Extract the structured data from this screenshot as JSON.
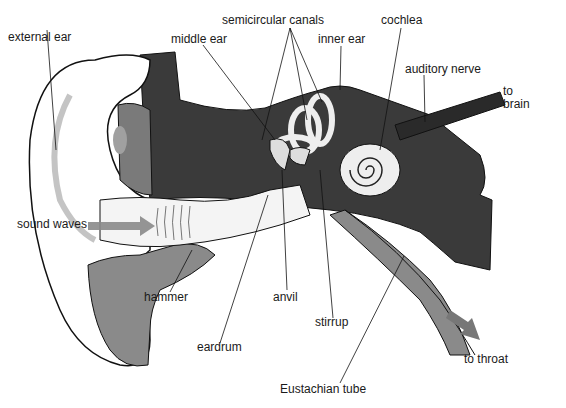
{
  "diagram": {
    "labels": {
      "external_ear": "external ear",
      "middle_ear": "middle ear",
      "semicircular_canals": "semicircular canals",
      "inner_ear": "inner ear",
      "cochlea": "cochlea",
      "auditory_nerve": "auditory nerve",
      "to_brain_1": "to",
      "to_brain_2": "brain",
      "sound_waves": "sound waves",
      "hammer": "hammer",
      "anvil": "anvil",
      "stirrup": "stirrup",
      "eardrum": "eardrum",
      "eustachian_tube": "Eustachian tube",
      "to_throat": "to throat"
    },
    "colors": {
      "bone": "#3a3a3a",
      "tissue": "#8a8a8a",
      "cartilage_spot": "#a0a0a0",
      "arrow": "#7a7a7a",
      "skin": "#ffffff",
      "outline": "#111111"
    }
  }
}
